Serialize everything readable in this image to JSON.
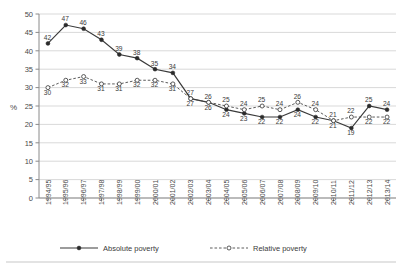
{
  "chart_data": {
    "type": "line",
    "title": "",
    "xlabel": "",
    "ylabel": "%",
    "ylim": [
      0,
      50
    ],
    "ytick_step": 5,
    "yticks": [
      "0",
      "5",
      "10",
      "15",
      "20",
      "25",
      "30",
      "35",
      "40",
      "45",
      "50"
    ],
    "grid": true,
    "grid_axis": "y",
    "legend_position": "bottom",
    "categories": [
      "1994/95",
      "1995/96",
      "1996/97",
      "1997/98",
      "1998/99",
      "1999/00",
      "2000/01",
      "2001/02",
      "2002/03",
      "2003/04",
      "2004/05",
      "2005/06",
      "2006/07",
      "2007/08",
      "2008/09",
      "2009/10",
      "2010/11",
      "2011/12",
      "2012/13",
      "2013/14"
    ],
    "series": [
      {
        "name": "Absolute poverty",
        "marker": "filled-circle",
        "linestyle": "solid",
        "color": "#2b2b2b",
        "values": [
          42,
          47,
          46,
          43,
          39,
          38,
          35,
          34,
          27,
          26,
          24,
          23,
          22,
          22,
          24,
          22,
          21,
          19,
          25,
          24
        ]
      },
      {
        "name": "Relative poverty",
        "marker": "hollow-circle",
        "linestyle": "dashed",
        "color": "#4a4a4a",
        "values": [
          30,
          32,
          33,
          31,
          31,
          32,
          32,
          31,
          27,
          26,
          25,
          24,
          25,
          24,
          26,
          24,
          21,
          22,
          22,
          22
        ]
      }
    ]
  },
  "legend": {
    "items": [
      {
        "label": "Absolute poverty"
      },
      {
        "label": "Relative poverty"
      }
    ]
  }
}
